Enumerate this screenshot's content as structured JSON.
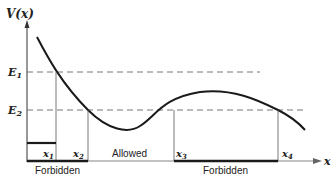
{
  "diagram": {
    "y_axis_label": "V(x)",
    "x_axis_label": "x",
    "energy_levels": [
      {
        "label": "E",
        "sub": "1",
        "y": 72
      },
      {
        "label": "E",
        "sub": "2",
        "y": 110
      }
    ],
    "turning_points": [
      {
        "label": "x",
        "sub": "1",
        "x": 56
      },
      {
        "label": "x",
        "sub": "2",
        "x": 88
      },
      {
        "label": "x",
        "sub": "3",
        "x": 174
      },
      {
        "label": "x",
        "sub": "4",
        "x": 278
      }
    ],
    "regions": {
      "forbidden_left": "Forbidden",
      "allowed": "Allowed",
      "forbidden_right": "Forbidden"
    },
    "colors": {
      "line": "#1a1a1a",
      "dashed": "#555555"
    }
  }
}
